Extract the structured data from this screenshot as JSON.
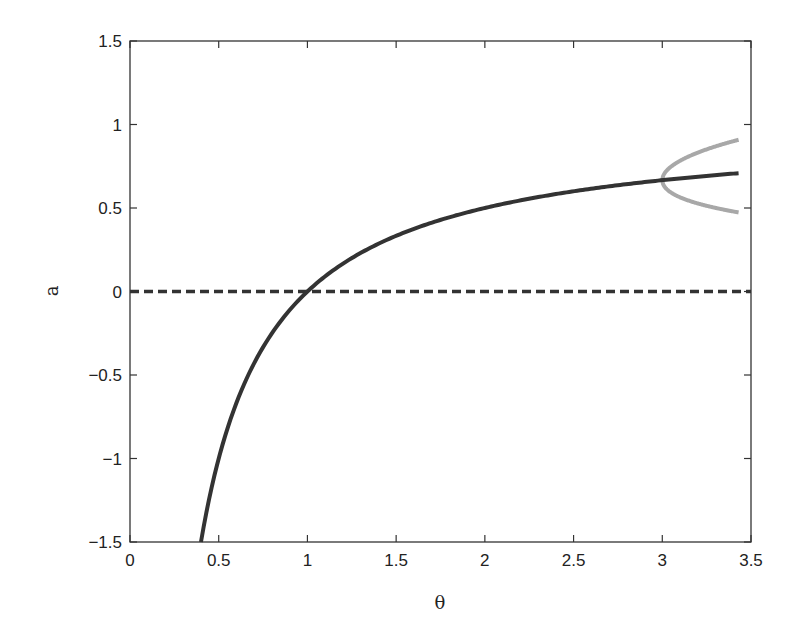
{
  "chart_data": {
    "type": "line",
    "title": "",
    "xlabel": "θ",
    "ylabel": "a",
    "xlim": [
      0,
      3.5
    ],
    "ylim": [
      -1.5,
      1.5
    ],
    "xticks": [
      0,
      0.5,
      1,
      1.5,
      2,
      2.5,
      3,
      3.5
    ],
    "xtick_labels": [
      "0",
      "0.5",
      "1",
      "1.5",
      "2",
      "2.5",
      "3",
      "3.5"
    ],
    "yticks": [
      -1.5,
      -1,
      -0.5,
      0,
      0.5,
      1,
      1.5
    ],
    "ytick_labels": [
      "−1.5",
      "−1",
      "−0.5",
      "0",
      "0.5",
      "1",
      "1.5"
    ],
    "grid": false,
    "legend": null,
    "series": [
      {
        "name": "nontrivial branch a = 1 − 1/θ",
        "style": "solid",
        "color": "#333333",
        "x": [
          0.4,
          0.45,
          0.5,
          0.6,
          0.7,
          0.8,
          0.9,
          1.0,
          1.2,
          1.4,
          1.6,
          1.8,
          2.0,
          2.2,
          2.5,
          2.8,
          3.0,
          3.2,
          3.43
        ],
        "y": [
          -1.5,
          -1.222,
          -1.0,
          -0.667,
          -0.429,
          -0.25,
          -0.111,
          0.0,
          0.167,
          0.286,
          0.375,
          0.444,
          0.5,
          0.545,
          0.6,
          0.643,
          0.667,
          0.688,
          0.708
        ]
      },
      {
        "name": "trivial branch a = 0",
        "style": "dashed",
        "color": "#333333",
        "x": [
          0,
          3.5
        ],
        "y": [
          0,
          0
        ]
      },
      {
        "name": "period-2 branch (upper)",
        "style": "solid",
        "color": "#a8a8a8",
        "x": [
          3.0,
          3.02,
          3.05,
          3.1,
          3.2,
          3.3,
          3.43
        ],
        "y": [
          0.667,
          0.72,
          0.745,
          0.77,
          0.8,
          0.825,
          0.85
        ]
      },
      {
        "name": "period-2 branch (lower)",
        "style": "solid",
        "color": "#a8a8a8",
        "x": [
          3.0,
          3.02,
          3.05,
          3.1,
          3.2,
          3.3,
          3.43
        ],
        "y": [
          0.667,
          0.615,
          0.59,
          0.56,
          0.52,
          0.485,
          0.44
        ]
      }
    ],
    "annotations": []
  }
}
